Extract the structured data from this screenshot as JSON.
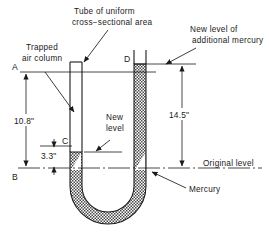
{
  "figure": {
    "title_absent": true,
    "annotations": {
      "tube_note_line1": "Tube of uniform",
      "tube_note_line2": "cross−sectional area",
      "trapped_line1": "Trapped",
      "trapped_line2": "air column",
      "newlevel_line1": "New",
      "newlevel_line2": "level",
      "addmerc_line1": "New level of",
      "addmerc_line2": "additional mercury",
      "original_level": "Original level",
      "mercury": "Mercury"
    },
    "points": {
      "a": "A",
      "b": "B",
      "c": "C",
      "d": "D"
    },
    "dimensions": {
      "left_total": "10.8\"",
      "left_small": "3.3\"",
      "right_total": "14.5\""
    },
    "colors": {
      "ink": "#1a1a1a",
      "mercury_fill": "#9a9a9a",
      "paper": "#ffffff"
    }
  }
}
